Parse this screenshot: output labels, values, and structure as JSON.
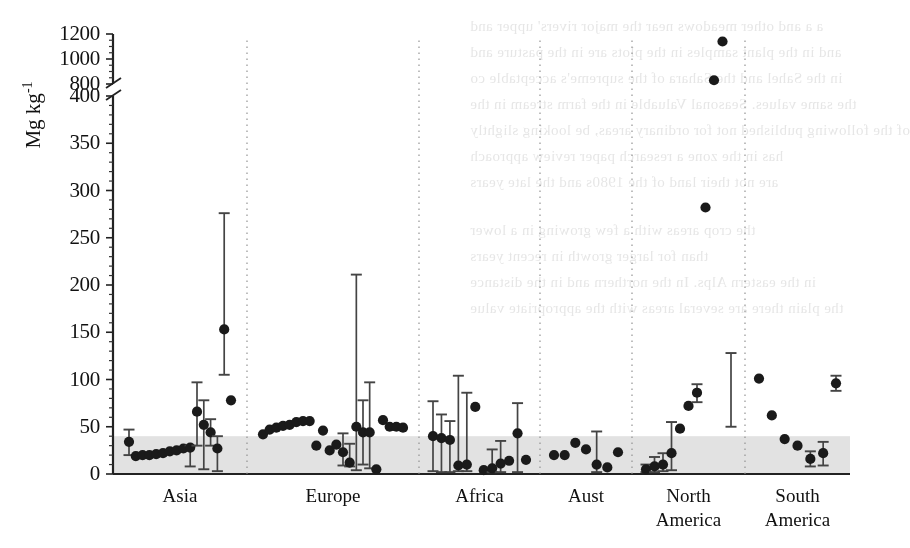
{
  "figure": {
    "ylabel": "Mg kg",
    "ylabel_exponent": "-1",
    "ylabel_full": "Mg kg-1"
  },
  "chart_data": {
    "type": "scatter",
    "title": "",
    "xlabel": "",
    "ylabel": "Mg kg-1",
    "grid": false,
    "legend_position": "none",
    "axis_break": {
      "lower_max": 400,
      "upper_min": 800
    },
    "ylim": [
      0,
      1200
    ],
    "ytick_labels": [
      "0",
      "50",
      "100",
      "150",
      "200",
      "250",
      "300",
      "350",
      "400",
      "800",
      "1000",
      "1200"
    ],
    "ytick_values": [
      0,
      50,
      100,
      150,
      200,
      250,
      300,
      350,
      400,
      800,
      1000,
      1200
    ],
    "shaded_band": {
      "from": 0,
      "to": 40,
      "color": "#e2e2e2",
      "note": "grey reference band"
    },
    "categories": [
      "Asia",
      "Europe",
      "Africa",
      "Aust",
      "North America",
      "South America"
    ],
    "marker_color": "#1a1a1a",
    "errorbar_color": "#444444",
    "series": [
      {
        "name": "Asia",
        "points": [
          {
            "x": 0,
            "y": 34,
            "lo": 20,
            "hi": 47
          },
          {
            "x": 1,
            "y": 19,
            "lo": null,
            "hi": null
          },
          {
            "x": 2,
            "y": 20,
            "lo": null,
            "hi": null
          },
          {
            "x": 3,
            "y": 20,
            "lo": null,
            "hi": null
          },
          {
            "x": 4,
            "y": 21,
            "lo": null,
            "hi": null
          },
          {
            "x": 5,
            "y": 22,
            "lo": null,
            "hi": null
          },
          {
            "x": 6,
            "y": 24,
            "lo": null,
            "hi": null
          },
          {
            "x": 7,
            "y": 25,
            "lo": null,
            "hi": null
          },
          {
            "x": 8,
            "y": 27,
            "lo": null,
            "hi": null
          },
          {
            "x": 9,
            "y": 28,
            "lo": 8,
            "hi": 30
          },
          {
            "x": 10,
            "y": 66,
            "lo": 30,
            "hi": 97
          },
          {
            "x": 11,
            "y": 52,
            "lo": 5,
            "hi": 78
          },
          {
            "x": 12,
            "y": 44,
            "lo": 30,
            "hi": 58
          },
          {
            "x": 13,
            "y": 27,
            "lo": 3,
            "hi": 40
          },
          {
            "x": 14,
            "y": 153,
            "lo": 105,
            "hi": 276
          },
          {
            "x": 15,
            "y": 78,
            "lo": null,
            "hi": null
          }
        ]
      },
      {
        "name": "Europe",
        "points": [
          {
            "x": 0,
            "y": 42,
            "lo": null,
            "hi": null
          },
          {
            "x": 1,
            "y": 47,
            "lo": null,
            "hi": null
          },
          {
            "x": 2,
            "y": 49,
            "lo": null,
            "hi": null
          },
          {
            "x": 3,
            "y": 51,
            "lo": null,
            "hi": null
          },
          {
            "x": 4,
            "y": 52,
            "lo": null,
            "hi": null
          },
          {
            "x": 5,
            "y": 55,
            "lo": null,
            "hi": null
          },
          {
            "x": 6,
            "y": 56,
            "lo": null,
            "hi": null
          },
          {
            "x": 7,
            "y": 56,
            "lo": null,
            "hi": null
          },
          {
            "x": 8,
            "y": 30,
            "lo": null,
            "hi": null
          },
          {
            "x": 9,
            "y": 46,
            "lo": null,
            "hi": null
          },
          {
            "x": 10,
            "y": 25,
            "lo": null,
            "hi": null
          },
          {
            "x": 11,
            "y": 31,
            "lo": null,
            "hi": null
          },
          {
            "x": 12,
            "y": 23,
            "lo": 9,
            "hi": 43
          },
          {
            "x": 13,
            "y": 12,
            "lo": 8,
            "hi": 32
          },
          {
            "x": 14,
            "y": 50,
            "lo": 4,
            "hi": 211
          },
          {
            "x": 15,
            "y": 44,
            "lo": 10,
            "hi": 78
          },
          {
            "x": 16,
            "y": 44,
            "lo": 6,
            "hi": 97
          },
          {
            "x": 17,
            "y": 5,
            "lo": null,
            "hi": null
          },
          {
            "x": 18,
            "y": 57,
            "lo": null,
            "hi": null
          },
          {
            "x": 19,
            "y": 50,
            "lo": null,
            "hi": null
          },
          {
            "x": 20,
            "y": 50,
            "lo": null,
            "hi": null
          },
          {
            "x": 21,
            "y": 49,
            "lo": null,
            "hi": null
          }
        ]
      },
      {
        "name": "Africa",
        "points": [
          {
            "x": 0,
            "y": 40,
            "lo": 3,
            "hi": 77
          },
          {
            "x": 1,
            "y": 38,
            "lo": 2,
            "hi": 63
          },
          {
            "x": 2,
            "y": 36,
            "lo": 2,
            "hi": 56
          },
          {
            "x": 3,
            "y": 9,
            "lo": 3,
            "hi": 104
          },
          {
            "x": 4,
            "y": 10,
            "lo": 3,
            "hi": 86
          },
          {
            "x": 5,
            "y": 71,
            "lo": null,
            "hi": null
          },
          {
            "x": 6,
            "y": 4,
            "lo": null,
            "hi": null
          },
          {
            "x": 7,
            "y": 6,
            "lo": 2,
            "hi": 26
          },
          {
            "x": 8,
            "y": 11,
            "lo": 2,
            "hi": 35
          },
          {
            "x": 9,
            "y": 14,
            "lo": null,
            "hi": null
          },
          {
            "x": 10,
            "y": 43,
            "lo": 2,
            "hi": 75
          },
          {
            "x": 11,
            "y": 15,
            "lo": null,
            "hi": null
          }
        ]
      },
      {
        "name": "Aust",
        "points": [
          {
            "x": 0,
            "y": 20,
            "lo": null,
            "hi": null
          },
          {
            "x": 1,
            "y": 20,
            "lo": null,
            "hi": null
          },
          {
            "x": 2,
            "y": 33,
            "lo": null,
            "hi": null
          },
          {
            "x": 3,
            "y": 26,
            "lo": null,
            "hi": null
          },
          {
            "x": 4,
            "y": 10,
            "lo": 2,
            "hi": 45
          },
          {
            "x": 5,
            "y": 7,
            "lo": null,
            "hi": null
          },
          {
            "x": 6,
            "y": 23,
            "lo": null,
            "hi": null
          }
        ]
      },
      {
        "name": "North America",
        "points": [
          {
            "x": 0,
            "y": 5,
            "lo": 2,
            "hi": 10
          },
          {
            "x": 1,
            "y": 8,
            "lo": 2,
            "hi": 18
          },
          {
            "x": 2,
            "y": 10,
            "lo": 3,
            "hi": 22
          },
          {
            "x": 3,
            "y": 22,
            "lo": 4,
            "hi": 55
          },
          {
            "x": 4,
            "y": 48,
            "lo": null,
            "hi": null
          },
          {
            "x": 5,
            "y": 72,
            "lo": null,
            "hi": null
          },
          {
            "x": 6,
            "y": 86,
            "lo": 76,
            "hi": 95
          },
          {
            "x": 7,
            "y": 282,
            "lo": null,
            "hi": null
          },
          {
            "x": 8,
            "y": 830,
            "lo": null,
            "hi": null
          },
          {
            "x": 9,
            "y": 1140,
            "lo": null,
            "hi": null
          },
          {
            "x": 10,
            "y": null,
            "lo": 50,
            "hi": 128
          }
        ]
      },
      {
        "name": "South America",
        "points": [
          {
            "x": 0,
            "y": 101,
            "lo": null,
            "hi": null
          },
          {
            "x": 1,
            "y": 62,
            "lo": null,
            "hi": null
          },
          {
            "x": 2,
            "y": 37,
            "lo": null,
            "hi": null
          },
          {
            "x": 3,
            "y": 30,
            "lo": null,
            "hi": null
          },
          {
            "x": 4,
            "y": 16,
            "lo": 8,
            "hi": 24
          },
          {
            "x": 5,
            "y": 22,
            "lo": 9,
            "hi": 34
          },
          {
            "x": 6,
            "y": 96,
            "lo": 88,
            "hi": 104
          }
        ]
      }
    ]
  },
  "ghost_text": [
    {
      "t": "a a and other meadows near the major rivers' upper and",
      "x": 470,
      "y": 18
    },
    {
      "t": "and in the plant samples in the plots are in the pasture and",
      "x": 470,
      "y": 44
    },
    {
      "t": "in the Sahel and the Sahara of the supreme's acceptable co",
      "x": 470,
      "y": 70
    },
    {
      "t": "the same values. Seasonal Valuable in the farm stream in the",
      "x": 470,
      "y": 96
    },
    {
      "t": "of the following published not for ordinary areas, be looking slightly",
      "x": 470,
      "y": 122
    },
    {
      "t": "has in the zone a research paper review approach",
      "x": 470,
      "y": 148
    },
    {
      "t": "are not their land of the 1980s and the late years",
      "x": 470,
      "y": 174
    },
    {
      "t": "the crop areas with a few growing in a lower",
      "x": 470,
      "y": 222
    },
    {
      "t": "than for larger growth in recent years",
      "x": 470,
      "y": 248
    },
    {
      "t": "in the eastern Alps. In the northern and in the distance",
      "x": 470,
      "y": 274
    },
    {
      "t": "the plain there are several areas with the appropriate value",
      "x": 470,
      "y": 300
    }
  ]
}
